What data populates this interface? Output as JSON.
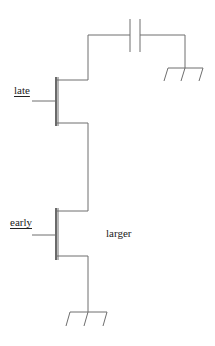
{
  "diagram": {
    "type": "transistor-circuit-schematic",
    "labels": {
      "late": "late",
      "early": "early",
      "larger": "larger"
    },
    "components": [
      {
        "id": "capacitor",
        "kind": "capacitor",
        "connects": [
          "top-node",
          "ground-right"
        ]
      },
      {
        "id": "transistor-late",
        "kind": "nmos",
        "gate_label": "late"
      },
      {
        "id": "transistor-early",
        "kind": "nmos",
        "gate_label": "early",
        "annotation": "larger"
      },
      {
        "id": "ground-right",
        "kind": "ground"
      },
      {
        "id": "ground-bottom",
        "kind": "ground"
      }
    ],
    "colors": {
      "wire": "#6e6e6e",
      "text": "#222222",
      "background": "#ffffff"
    }
  }
}
